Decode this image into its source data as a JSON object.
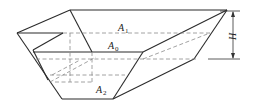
{
  "diagram": {
    "type": "hopper-frustum",
    "labels": {
      "top_area": {
        "main": "A",
        "sub": "1"
      },
      "mid_area": {
        "main": "A",
        "sub": "0"
      },
      "bottom_area": {
        "main": "A",
        "sub": "2"
      },
      "height": "H"
    },
    "colors": {
      "solid_line": "#2b2b2b",
      "dashed_line": "#8a8a8a"
    }
  }
}
